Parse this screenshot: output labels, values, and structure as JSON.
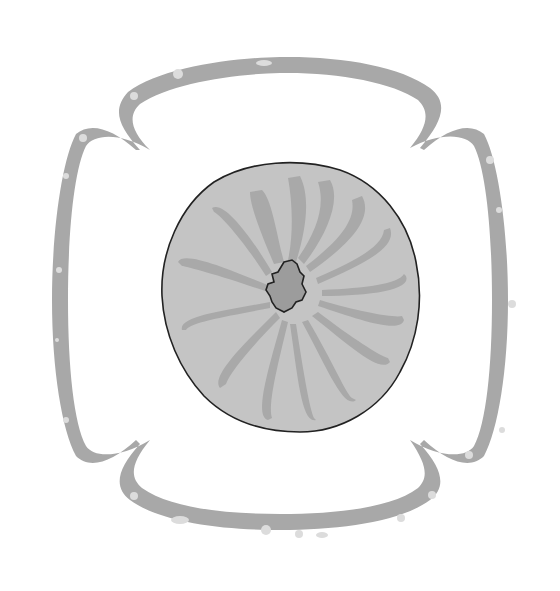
{
  "figure": {
    "colors": {
      "background": "#ffffff",
      "outer_band": "#a8a8a8",
      "outer_spots": "#dcdcdc",
      "body_fill": "#c4c4c4",
      "body_folds": "#a9a9a9",
      "center_cavity": "#9c9c9c",
      "outline": "#222222"
    }
  }
}
